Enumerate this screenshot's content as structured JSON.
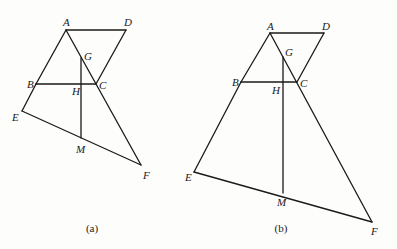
{
  "figures": [
    {
      "id": "a",
      "caption": "(a)",
      "points": {
        "A": "A",
        "D": "D",
        "G": "G",
        "B": "B",
        "H": "H",
        "C": "C",
        "E": "E",
        "M": "M",
        "F": "F"
      },
      "segments": [
        "AD",
        "DC",
        "AB",
        "BE",
        "AF",
        "BC",
        "EF",
        "GM"
      ]
    },
    {
      "id": "b",
      "caption": "(b)",
      "points": {
        "A": "A",
        "D": "D",
        "G": "G",
        "B": "B",
        "H": "H",
        "C": "C",
        "E": "E",
        "M": "M",
        "F": "F"
      },
      "segments": [
        "AD",
        "DC",
        "AB",
        "BE",
        "AF",
        "BC",
        "EF",
        "GM"
      ]
    }
  ]
}
